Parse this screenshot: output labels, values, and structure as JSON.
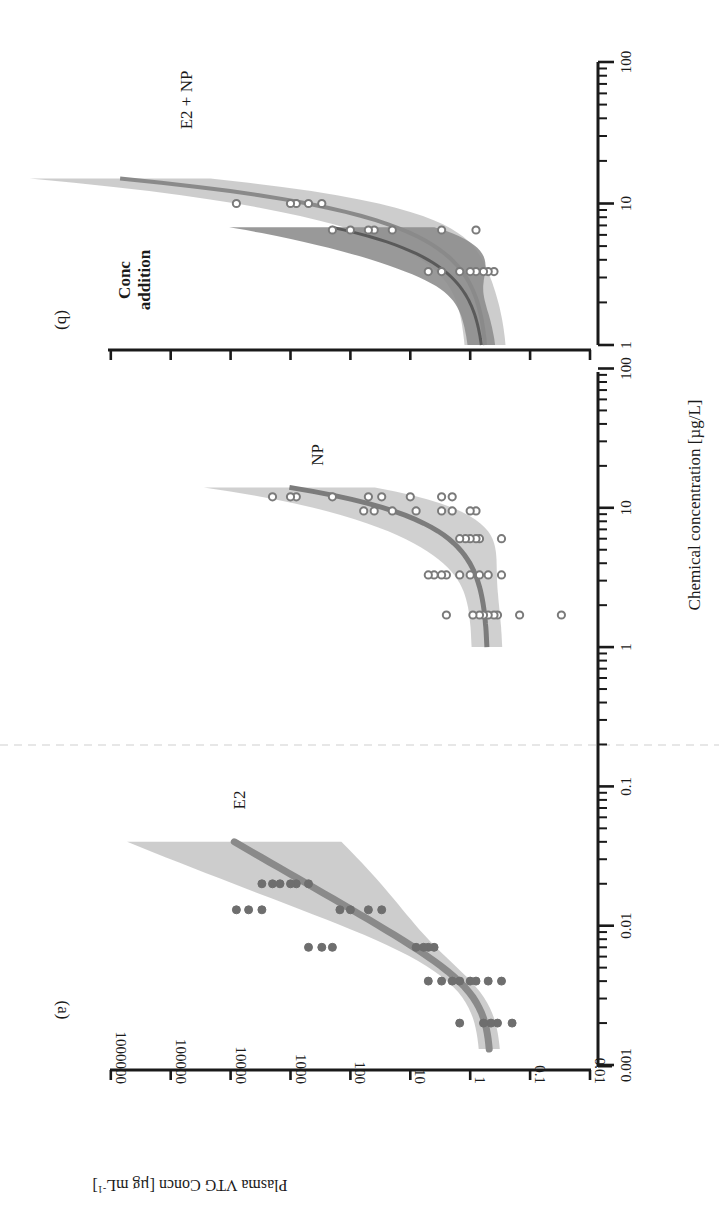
{
  "chart_data": [
    {
      "panel": "(a)",
      "type": "scatter",
      "orientation": "rotated 90° (page rotated; x-axis runs vertically, y-axis runs horizontally)",
      "xlabel": "Chemical concentration [µg/L]",
      "ylabel": "Plasma VTG Concn [µg mL-1]",
      "xscale": "log",
      "yscale": "log",
      "xlim": [
        0.001,
        100
      ],
      "ylim": [
        0.01,
        1000000
      ],
      "x_ticks": [
        "0.001",
        "0.01",
        "0.1",
        "1",
        "10",
        "100"
      ],
      "y_ticks": [
        "0.01",
        "0.1",
        "1",
        "10",
        "100",
        "1000",
        "10000",
        "100000",
        "1000000"
      ],
      "grid": false,
      "series": [
        {
          "name": "E2",
          "marker": "filled circle",
          "color": "#6e6e6e",
          "points": [
            {
              "x": 0.002,
              "y": [
                0.2,
                0.35,
                0.45,
                0.6,
                1.5
              ]
            },
            {
              "x": 0.004,
              "y": [
                0.3,
                0.5,
                0.8,
                1.0,
                1.5,
                2,
                3,
                5
              ]
            },
            {
              "x": 0.007,
              "y": [
                4,
                5,
                6,
                8,
                200,
                300,
                500
              ]
            },
            {
              "x": 0.013,
              "y": [
                30,
                50,
                100,
                150,
                3000,
                5000,
                8000
              ]
            },
            {
              "x": 0.02,
              "y": [
                500,
                800,
                1000,
                1500,
                2000,
                3000
              ]
            }
          ],
          "fit_curve": {
            "color": "#8a8a8a",
            "x_range": [
              0.0013,
              0.04
            ],
            "y_range": [
              0.45,
              40000
            ]
          },
          "confidence_band": {
            "color": "#bdbdbd"
          },
          "annotation": "E2"
        },
        {
          "name": "NP",
          "marker": "open circle",
          "color": "#7a7a7a",
          "points": [
            {
              "x": 1.7,
              "y": [
                0.03,
                0.15,
                0.35,
                0.4,
                0.5,
                0.6,
                0.7,
                0.9,
                2.5
              ]
            },
            {
              "x": 3.3,
              "y": [
                0.3,
                0.5,
                0.7,
                1.0,
                1.5,
                2.5,
                3,
                4,
                5
              ]
            },
            {
              "x": 6,
              "y": [
                0.3,
                0.7,
                0.8,
                1.0,
                1.2,
                1.5
              ]
            },
            {
              "x": 9.5,
              "y": [
                0.8,
                1,
                2,
                3,
                8,
                20,
                40,
                60
              ]
            },
            {
              "x": 12,
              "y": [
                2,
                3,
                10,
                30,
                50,
                200,
                800,
                1000,
                2000
              ]
            }
          ],
          "fit_curve": {
            "color": "#7e7e7e",
            "x_range": [
              1,
              14
            ],
            "y_range": [
              0.5,
              2000
            ]
          },
          "confidence_band": {
            "color": "#c4c4c4"
          },
          "annotation": "NP"
        }
      ]
    },
    {
      "panel": "(b)",
      "type": "scatter",
      "xlabel": "Chemical concentration [µg/L]",
      "ylabel": "Plasma VTG Concn [µg mL-1]",
      "xscale": "log",
      "yscale": "log",
      "xlim": [
        1,
        100
      ],
      "ylim": [
        0.01,
        1000000
      ],
      "x_ticks": [
        "1",
        "10",
        "100"
      ],
      "grid": false,
      "series": [
        {
          "name": "E2 + NP",
          "marker": "open circle",
          "color": "#7a7a7a",
          "points": [
            {
              "x": 3.3,
              "y": [
                0.4,
                0.5,
                0.6,
                0.8,
                1.0,
                1.5,
                3,
                5
              ]
            },
            {
              "x": 6.5,
              "y": [
                0.8,
                3,
                20,
                40,
                50,
                100,
                200
              ]
            },
            {
              "x": 10,
              "y": [
                300,
                500,
                800,
                1000,
                8000
              ]
            }
          ],
          "fit_curve": {
            "color": "#8a8a8a",
            "x_range": [
              1,
              15
            ],
            "y_range": [
              0.5,
              20000
            ]
          },
          "confidence_band": {
            "color": "#c6c6c6"
          },
          "annotation": "E2 + NP"
        },
        {
          "name": "Conc addition",
          "type": "line",
          "color": "#5c5c5c",
          "fit_curve": {
            "x_range": [
              1,
              6.5
            ],
            "y_range": [
              0.5,
              3000
            ]
          },
          "confidence_band": {
            "color": "#8c8c8c"
          },
          "annotation": "Conc addition"
        }
      ]
    }
  ],
  "labels": {
    "panel_a": "(a)",
    "panel_b": "(b)",
    "xlabel": "Chemical concentration [µg/L]",
    "ylabel": "Plasma VTG Concn [µg mL",
    "ylabel_sup": "-1",
    "ylabel_end": "]",
    "e2": "E2",
    "np": "NP",
    "e2np": "E2 + NP",
    "conc_addition_1": "Conc",
    "conc_addition_2": "addition",
    "yticks": [
      "1000000",
      "100000",
      "10000",
      "1000",
      "100",
      "10",
      "1",
      "0.1",
      "0.01"
    ],
    "xticks_a": [
      "0.001",
      "0.01",
      "0.1",
      "1",
      "10",
      "100"
    ],
    "xticks_b": [
      "1",
      "10",
      "100"
    ]
  }
}
